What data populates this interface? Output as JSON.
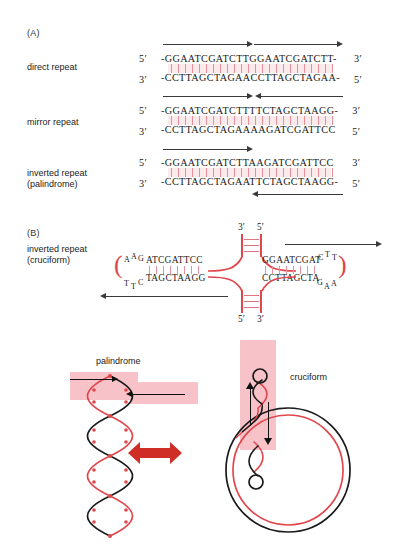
{
  "panels": {
    "a_letter": "(A)",
    "b_letter": "(B)"
  },
  "panel_a": {
    "rows": [
      {
        "label": "direct repeat",
        "five_left": "5′",
        "three_right": "3′",
        "top_seq": "-GGAATCGATCTTGGAATCGATCTT-",
        "bottom_seq": "-CCTTAGCTAGAACCTTAGCTAGAA-",
        "three_left": "3′",
        "five_right": "5′",
        "arrow_style": "two-right"
      },
      {
        "label": "mirror repeat",
        "five_left": "5′",
        "three_right": "3′",
        "top_seq": "-GGAATCGATCTTTTCTAGCTAAGG-",
        "bottom_seq": "-CCTTAGCTAGAAAAGATCGATTCC",
        "three_left": "3′",
        "five_right": "5′",
        "arrow_style": "converging"
      },
      {
        "label": "inverted repeat\n(palindrome)",
        "five_left": "5′",
        "three_right": "3′",
        "top_seq": "-GGAATCGATCTTAAGATCGATTCC",
        "bottom_seq": "-CCTTAGCTAGAATTCTAGCTAAGG-",
        "three_left": "3′",
        "five_right": "5′",
        "arrow_style": "top-right-bottom-left"
      }
    ]
  },
  "panel_b": {
    "label": "inverted repeat\n(cruciform)",
    "stem_top_left_prime": "3′",
    "stem_top_right_prime": "5′",
    "stem_bottom_left_prime": "5′",
    "stem_bottom_right_prime": "3′",
    "left_arm_top": "ATCGATTCC",
    "left_arm_bottom": "TAGCTAAGG",
    "right_arm_top": "GGAATCGAT",
    "right_arm_bottom": "CCTTAGCTA",
    "left_loop_top": [
      "A",
      "A",
      "G"
    ],
    "left_loop_bottom": [
      "T",
      "T",
      "C"
    ],
    "right_loop_top": [
      "C",
      "T",
      "T"
    ],
    "right_loop_bottom": [
      "G",
      "A",
      "A"
    ]
  },
  "bottom": {
    "palindrome_label": "palindrome",
    "cruciform_label": "cruciform"
  },
  "colors": {
    "dna_red": "#e0474c",
    "dna_black": "#1a1a1a",
    "highlight_band": "#f7c3c8",
    "rung_pink": "#e8909a",
    "shade_pink": "#fbeaec",
    "arrow_gray": "#3a3a3a"
  }
}
